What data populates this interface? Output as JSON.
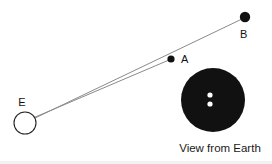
{
  "figure": {
    "background_color": "#ffffff",
    "line_color": "#8a8a8a",
    "body_color": "#111111",
    "disk_color": "#111111",
    "dot_color": "#ffffff"
  },
  "earth": {
    "label": "E",
    "cx": 25,
    "cy": 123,
    "r": 11,
    "label_x": 22,
    "label_y": 106,
    "stroke": "#222222"
  },
  "points": [
    {
      "label": "A",
      "cx": 171,
      "cy": 59,
      "r": 3.6,
      "label_x": 181,
      "label_y": 63,
      "color": "#111111"
    },
    {
      "label": "B",
      "cx": 245,
      "cy": 17,
      "r": 5.2,
      "label_x": 240,
      "label_y": 38,
      "color": "#111111"
    }
  ],
  "sightlines": [
    {
      "name": "line-to-a",
      "x1": 33,
      "y1": 118,
      "x2": 169,
      "y2": 60
    },
    {
      "name": "line-to-b",
      "x1": 33,
      "y1": 119,
      "x2": 242,
      "y2": 19
    }
  ],
  "view_from_earth": {
    "caption": "View from Earth",
    "caption_x": 220,
    "caption_y": 152,
    "disk": {
      "cx": 213,
      "cy": 100,
      "r": 32
    },
    "dots": [
      {
        "name": "dot-upper",
        "cx": 210,
        "cy": 95,
        "r": 2.6
      },
      {
        "name": "dot-lower",
        "cx": 210,
        "cy": 104,
        "r": 2.6
      }
    ]
  }
}
